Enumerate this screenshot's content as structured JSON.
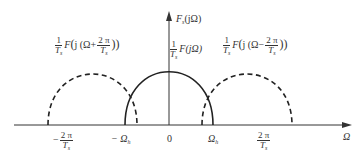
{
  "diagram": {
    "y_axis_label": {
      "main": "F",
      "sub": "s",
      "arg": "(jΩ)"
    },
    "x_axis_label": "Ω",
    "origin_label": "0",
    "curves": [
      {
        "id": "left-replica",
        "style": "dashed",
        "label_prefix": "1",
        "label_den": "T",
        "label_den_sub": "s",
        "label_fn": "F",
        "label_inner": "j (Ω+",
        "label_frac_num": "2 π",
        "label_frac_den": "T",
        "label_frac_den_sub": "s",
        "label_close": "))",
        "center": "-2π/Ts"
      },
      {
        "id": "baseband",
        "style": "solid",
        "label_prefix": "1",
        "label_den": "T",
        "label_den_sub": "s",
        "label_fn": "F(jΩ)",
        "center": "0"
      },
      {
        "id": "right-replica",
        "style": "dashed",
        "label_prefix": "1",
        "label_den": "T",
        "label_den_sub": "s",
        "label_fn": "F",
        "label_inner": "j (Ω−",
        "label_frac_num": "2 π",
        "label_frac_den": "T",
        "label_frac_den_sub": "s",
        "label_close": "))",
        "center": "2π/Ts"
      }
    ],
    "ticks": [
      {
        "id": "neg-2pi-ts",
        "sign": "−",
        "num": "2 π",
        "den": "T",
        "den_sub": "s"
      },
      {
        "id": "neg-omega-h",
        "text": "− Ω",
        "sub": "h"
      },
      {
        "id": "zero",
        "text": "0"
      },
      {
        "id": "omega-h",
        "text": "Ω",
        "sub": "h"
      },
      {
        "id": "pos-2pi-ts",
        "num": "2 π",
        "den": "T",
        "den_sub": "s"
      }
    ]
  }
}
